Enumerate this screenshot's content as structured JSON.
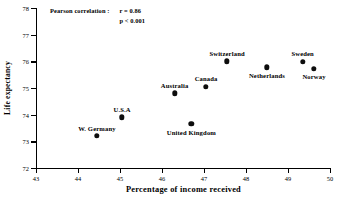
{
  "chart_data": {
    "type": "scatter",
    "title": "",
    "xlabel": "Percentage of  income received",
    "ylabel": "Life expectancy",
    "xlim": [
      43,
      50
    ],
    "ylim": [
      72,
      78
    ],
    "xticks": [
      43,
      44,
      45,
      46,
      47,
      48,
      49,
      50
    ],
    "yticks": [
      72,
      73,
      74,
      75,
      76,
      77,
      78
    ],
    "grid": false,
    "legend": "none",
    "annotation": {
      "label": "Pearson correlation :",
      "r": "r = 0.86",
      "p": "p < 0.001"
    },
    "points": [
      {
        "name": "W. Germany",
        "x": 44.45,
        "y": 73.2,
        "label_pos": "above"
      },
      {
        "name": "U.S.A",
        "x": 45.05,
        "y": 73.9,
        "label_pos": "above"
      },
      {
        "name": "Australia",
        "x": 46.3,
        "y": 74.8,
        "label_pos": "above"
      },
      {
        "name": "United Kingdom",
        "x": 46.7,
        "y": 73.65,
        "label_pos": "below"
      },
      {
        "name": "Canada",
        "x": 47.05,
        "y": 75.05,
        "label_pos": "above"
      },
      {
        "name": "Switzerland",
        "x": 47.55,
        "y": 76.0,
        "label_pos": "above"
      },
      {
        "name": "Netherlands",
        "x": 48.5,
        "y": 75.78,
        "label_pos": "below"
      },
      {
        "name": "Sweden",
        "x": 49.35,
        "y": 75.98,
        "label_pos": "above"
      },
      {
        "name": "Norway",
        "x": 49.62,
        "y": 75.72,
        "label_pos": "below"
      }
    ]
  }
}
